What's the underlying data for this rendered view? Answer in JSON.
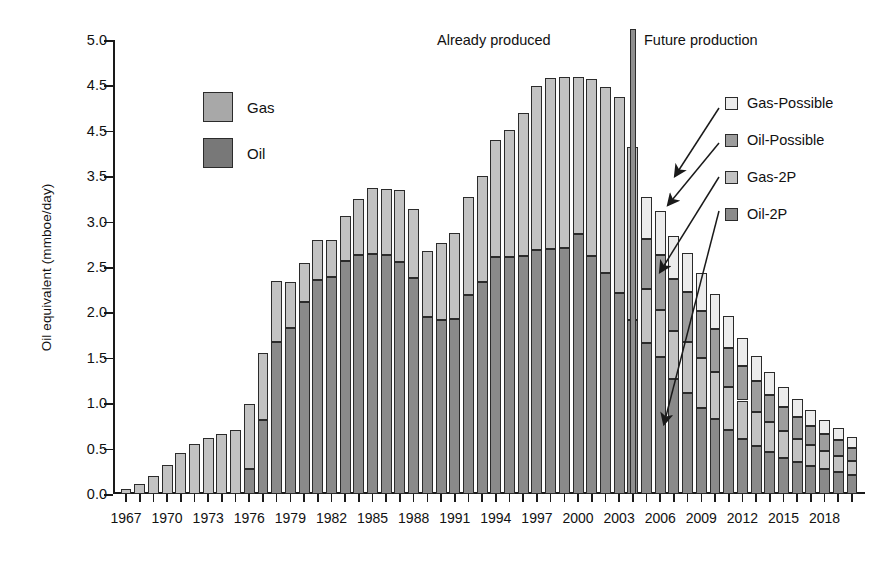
{
  "chart_data": {
    "type": "bar",
    "stacked": true,
    "title": "",
    "xlabel": "",
    "ylabel": "Oil equivalent (mmboe/day)",
    "ylim": [
      0.0,
      5.0
    ],
    "ytick_labels": [
      "5.0",
      "4.5",
      "4.5",
      "3.5",
      "3.0",
      "2.5",
      "2.0",
      "1.5",
      "1.0",
      "0.5",
      "0.0"
    ],
    "ytick_values": [
      5.0,
      4.5,
      4.0,
      3.5,
      3.0,
      2.5,
      2.0,
      1.5,
      1.0,
      0.5,
      0.0
    ],
    "grid": false,
    "legend_position": "inside-left and inside-right",
    "x": [
      1967,
      1968,
      1969,
      1970,
      1971,
      1972,
      1973,
      1974,
      1975,
      1976,
      1977,
      1978,
      1979,
      1980,
      1981,
      1982,
      1983,
      1984,
      1985,
      1986,
      1987,
      1988,
      1989,
      1990,
      1991,
      1992,
      1993,
      1994,
      1995,
      1996,
      1997,
      1998,
      1999,
      2000,
      2001,
      2002,
      2003,
      2004,
      2005,
      2006,
      2007,
      2008,
      2009,
      2010,
      2011,
      2012,
      2013,
      2014,
      2015,
      2016,
      2017,
      2018,
      2019,
      2020
    ],
    "xtick_labels": [
      "1967",
      "1970",
      "1973",
      "1976",
      "1979",
      "1982",
      "1985",
      "1988",
      "1991",
      "1994",
      "1997",
      "2000",
      "2003",
      "2006",
      "2009",
      "2012",
      "2015",
      "2018"
    ],
    "series": [
      {
        "name": "Oil",
        "key": "oil2p",
        "color": "#8a8a8a",
        "values": [
          0.0,
          0.0,
          0.0,
          0.0,
          0.0,
          0.0,
          0.0,
          0.0,
          0.0,
          0.28,
          0.82,
          1.67,
          1.83,
          2.12,
          2.36,
          2.39,
          2.57,
          2.63,
          2.64,
          2.63,
          2.55,
          2.38,
          1.95,
          1.92,
          1.93,
          2.19,
          2.33,
          2.61,
          2.61,
          2.62,
          2.69,
          2.7,
          2.71,
          2.86,
          2.62,
          2.43,
          2.21,
          1.92,
          1.66,
          1.51,
          1.27,
          1.11,
          0.95,
          0.83,
          0.71,
          0.61,
          0.53,
          0.46,
          0.4,
          0.35,
          0.31,
          0.27,
          0.24,
          0.21
        ]
      },
      {
        "name": "Gas",
        "key": "gas2p",
        "color": "#c2c2c2",
        "values": [
          0.05,
          0.11,
          0.2,
          0.32,
          0.45,
          0.55,
          0.62,
          0.66,
          0.7,
          0.71,
          0.73,
          0.68,
          0.51,
          0.42,
          0.44,
          0.41,
          0.49,
          0.62,
          0.73,
          0.73,
          0.8,
          0.76,
          0.73,
          0.84,
          0.94,
          1.08,
          1.17,
          1.29,
          1.4,
          1.58,
          1.8,
          1.88,
          1.88,
          1.73,
          1.95,
          2.05,
          2.16,
          1.9,
          0.6,
          0.52,
          0.52,
          0.56,
          0.55,
          0.51,
          0.47,
          0.42,
          0.37,
          0.33,
          0.29,
          0.26,
          0.23,
          0.2,
          0.18,
          0.15
        ]
      },
      {
        "name": "Oil-Possible",
        "key": "oilpossible",
        "color": "#9d9d9d",
        "values": [
          0,
          0,
          0,
          0,
          0,
          0,
          0,
          0,
          0,
          0,
          0,
          0,
          0,
          0,
          0,
          0,
          0,
          0,
          0,
          0,
          0,
          0,
          0,
          0,
          0,
          0,
          0,
          0,
          0,
          0,
          0,
          0,
          0,
          0,
          0,
          0,
          0,
          0,
          0.55,
          0.6,
          0.58,
          0.55,
          0.52,
          0.48,
          0.43,
          0.38,
          0.34,
          0.3,
          0.27,
          0.24,
          0.21,
          0.19,
          0.17,
          0.15
        ]
      },
      {
        "name": "Gas-Possible",
        "key": "gaspossible",
        "color": "#ececec",
        "values": [
          0,
          0,
          0,
          0,
          0,
          0,
          0,
          0,
          0,
          0,
          0,
          0,
          0,
          0,
          0,
          0,
          0,
          0,
          0,
          0,
          0,
          0,
          0,
          0,
          0,
          0,
          0,
          0,
          0,
          0,
          0,
          0,
          0,
          0,
          0,
          0,
          0,
          0,
          0.46,
          0.49,
          0.47,
          0.44,
          0.41,
          0.38,
          0.35,
          0.31,
          0.28,
          0.25,
          0.22,
          0.2,
          0.18,
          0.16,
          0.14,
          0.12
        ]
      }
    ],
    "divider": {
      "x_year": 2004,
      "top_value": 5.12,
      "color": "#8f8f8f"
    }
  },
  "annotations": {
    "already_produced": "Already produced",
    "future_production": "Future production"
  },
  "legend_left": {
    "items": [
      {
        "label": "Gas",
        "color": "#a8a8a8",
        "key": "gas"
      },
      {
        "label": "Oil",
        "color": "#787878",
        "key": "oil"
      }
    ]
  },
  "legend_right": {
    "items": [
      {
        "label": "Gas-Possible",
        "color": "#ececec",
        "key": "gaspossible"
      },
      {
        "label": "Oil-Possible",
        "color": "#9d9d9d",
        "key": "oilpossible"
      },
      {
        "label": "Gas-2P",
        "color": "#c2c2c2",
        "key": "gas2p"
      },
      {
        "label": "Oil-2P",
        "color": "#8a8a8a",
        "key": "oil2p"
      }
    ]
  }
}
